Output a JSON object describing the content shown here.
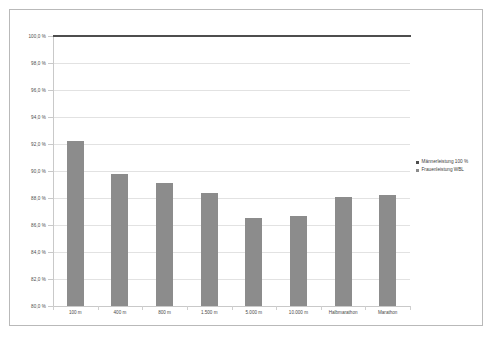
{
  "chart_data": {
    "type": "bar",
    "title": "",
    "xlabel": "",
    "ylabel": "",
    "ylim": [
      80.0,
      100.0
    ],
    "ytick_step": 2.0,
    "grid": true,
    "legend_position": "right",
    "categories": [
      "100 m",
      "400 m",
      "800 m",
      "1.500 m",
      "5.000 m",
      "10.000 m",
      "Halbmarathon",
      "Marathon"
    ],
    "ytick_labels": [
      "100,0 %",
      "98,0 %",
      "96,0 %",
      "94,0 %",
      "92,0 %",
      "90,0 %",
      "88,0 %",
      "86,0 %",
      "84,0 %",
      "82,0 %",
      "80,0 %"
    ],
    "ytick_values": [
      100.0,
      98.0,
      96.0,
      94.0,
      92.0,
      90.0,
      88.0,
      86.0,
      84.0,
      82.0,
      80.0
    ],
    "series": [
      {
        "name": "Männerleistung 100 %",
        "type": "line",
        "color": "#4d4d4d",
        "values": [
          100.0,
          100.0,
          100.0,
          100.0,
          100.0,
          100.0,
          100.0,
          100.0
        ]
      },
      {
        "name": "Frauenleistung WBL",
        "type": "bar",
        "color": "#8c8c8c",
        "values": [
          92.2,
          89.8,
          89.1,
          88.4,
          86.5,
          86.7,
          88.1,
          88.2
        ]
      }
    ]
  },
  "legend": {
    "items": [
      {
        "label": "Männerleistung 100 %",
        "marker": "series-line"
      },
      {
        "label": "Frauenleistung WBL",
        "marker": "series-bar"
      }
    ]
  }
}
